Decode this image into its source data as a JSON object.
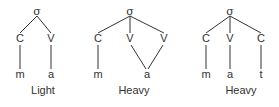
{
  "diagram": {
    "type": "syllable-structure-trees",
    "colors": {
      "ink": "#333333",
      "background": "#ffffff"
    },
    "trees": [
      {
        "caption": "Light",
        "root": {
          "label": "σ",
          "x": 37,
          "y": 12
        },
        "skeleton": [
          {
            "label": "C",
            "x": 20,
            "y": 39
          },
          {
            "label": "V",
            "x": 51,
            "y": 39
          }
        ],
        "segments": [
          {
            "label": "m",
            "x": 20,
            "y": 75
          },
          {
            "label": "a",
            "x": 51,
            "y": 75
          }
        ],
        "caption_pos": {
          "x": 43,
          "y": 91
        },
        "edges": [
          [
            37,
            16,
            20,
            33
          ],
          [
            37,
            16,
            51,
            33
          ],
          [
            20,
            45,
            20,
            69
          ],
          [
            51,
            45,
            51,
            69
          ]
        ]
      },
      {
        "caption": "Heavy",
        "root": {
          "label": "σ",
          "x": 130,
          "y": 12
        },
        "skeleton": [
          {
            "label": "C",
            "x": 98,
            "y": 39
          },
          {
            "label": "V",
            "x": 130,
            "y": 39
          },
          {
            "label": "V",
            "x": 164,
            "y": 39
          }
        ],
        "segments": [
          {
            "label": "m",
            "x": 98,
            "y": 75
          },
          {
            "label": "a",
            "x": 147,
            "y": 75
          }
        ],
        "caption_pos": {
          "x": 134,
          "y": 91
        },
        "edges": [
          [
            130,
            16,
            98,
            33
          ],
          [
            130,
            16,
            130,
            33
          ],
          [
            130,
            16,
            164,
            33
          ],
          [
            98,
            45,
            98,
            69
          ],
          [
            131,
            45,
            146,
            69
          ],
          [
            163,
            45,
            148,
            69
          ]
        ]
      },
      {
        "caption": "Heavy",
        "root": {
          "label": "σ",
          "x": 230,
          "y": 12
        },
        "skeleton": [
          {
            "label": "C",
            "x": 206,
            "y": 39
          },
          {
            "label": "V",
            "x": 230,
            "y": 39
          },
          {
            "label": "C",
            "x": 261,
            "y": 39
          }
        ],
        "segments": [
          {
            "label": "m",
            "x": 206,
            "y": 75
          },
          {
            "label": "a",
            "x": 230,
            "y": 75
          },
          {
            "label": "t",
            "x": 261,
            "y": 75
          }
        ],
        "caption_pos": {
          "x": 241,
          "y": 91
        },
        "edges": [
          [
            230,
            16,
            206,
            33
          ],
          [
            230,
            16,
            230,
            33
          ],
          [
            230,
            16,
            261,
            33
          ],
          [
            206,
            45,
            206,
            69
          ],
          [
            230,
            45,
            230,
            69
          ],
          [
            261,
            45,
            261,
            69
          ]
        ]
      }
    ]
  }
}
